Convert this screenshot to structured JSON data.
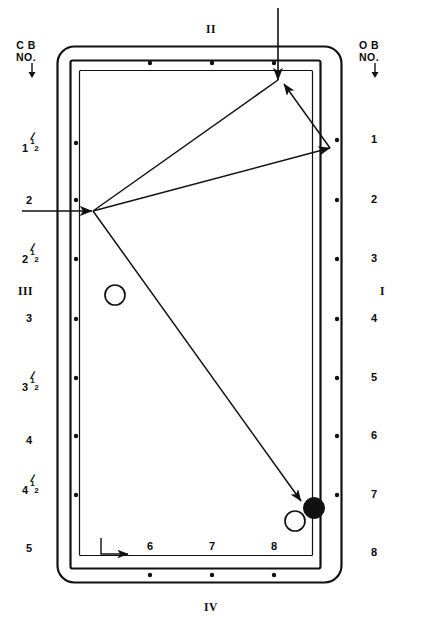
{
  "diagram": {
    "table": {
      "rail_color": "#111111",
      "cloth_color": "#ffffff",
      "line_color": "#111111"
    },
    "headers": {
      "left": {
        "line1": "C B",
        "line2": "NO.",
        "arrow": "down-arrow-icon"
      },
      "right": {
        "line1": "O B",
        "line2": "NO.",
        "arrow": "down-arrow-icon"
      }
    },
    "side_markers": {
      "top": "II",
      "right": "I",
      "left": "III",
      "bottom": "IV"
    },
    "left_scale": [
      {
        "whole": "1",
        "num": "1",
        "den": "2",
        "y": 145
      },
      {
        "whole": "2",
        "num": "",
        "den": "",
        "y": 200
      },
      {
        "whole": "2",
        "num": "1",
        "den": "2",
        "y": 256
      },
      {
        "whole": "3",
        "num": "",
        "den": "",
        "y": 318
      },
      {
        "whole": "3",
        "num": "1",
        "den": "2",
        "y": 384
      },
      {
        "whole": "4",
        "num": "",
        "den": "",
        "y": 440
      },
      {
        "whole": "4",
        "num": "1",
        "den": "2",
        "y": 487
      },
      {
        "whole": "5",
        "num": "",
        "den": "",
        "y": 548
      }
    ],
    "right_scale": [
      {
        "label": "1",
        "y": 140
      },
      {
        "label": "2",
        "y": 200
      },
      {
        "label": "3",
        "y": 259
      },
      {
        "label": "4",
        "y": 319
      },
      {
        "label": "5",
        "y": 378
      },
      {
        "label": "6",
        "y": 436
      },
      {
        "label": "7",
        "y": 495
      },
      {
        "label": "8",
        "y": 553
      }
    ],
    "bottom_scale": [
      {
        "label": "6",
        "x": 150
      },
      {
        "label": "7",
        "x": 212
      },
      {
        "label": "8",
        "x": 274
      }
    ],
    "balls": [
      {
        "name": "cue-ball-left",
        "kind": "hollow",
        "cx": 115,
        "cy": 295,
        "r": 10
      },
      {
        "name": "object-ball",
        "kind": "filled",
        "cx": 314,
        "cy": 508,
        "r": 10
      },
      {
        "name": "cue-ball-bottom",
        "kind": "hollow",
        "cx": 295,
        "cy": 521,
        "r": 10
      }
    ],
    "shot_path": {
      "entry_arrow_top": {
        "x1": 278,
        "y1": 8,
        "x2": 278,
        "y2": 78
      },
      "entry_arrow_left": {
        "x1": 22,
        "y1": 211,
        "x2": 92,
        "y2": 211
      },
      "segments": [
        {
          "from": [
            278,
            80
          ],
          "to": [
            92,
            211
          ],
          "arrow_at_end": false
        },
        {
          "from": [
            92,
            211
          ],
          "to": [
            330,
            148
          ],
          "arrow_at_end": true
        },
        {
          "from": [
            330,
            148
          ],
          "to": [
            283,
            84
          ],
          "arrow_at_end": true
        },
        {
          "from": [
            92,
            211
          ],
          "to": [
            300,
            500
          ],
          "arrow_at_end": true
        }
      ]
    },
    "corner_axis_marker": {
      "x": 100,
      "y": 538,
      "width": 34,
      "height": 18
    },
    "rail_diamonds": {
      "top_count": 3,
      "bottom_count": 3,
      "left_count": 7,
      "right_count": 7
    }
  }
}
